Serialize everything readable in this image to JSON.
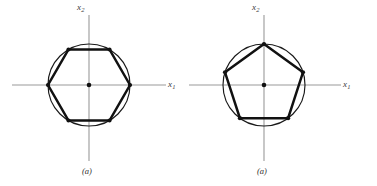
{
  "figure": {
    "background_color": "#ffffff",
    "ink_color": "#111111",
    "axis_color": "#9a9a9a",
    "panels": [
      {
        "id": "a-left",
        "caption": "(a)",
        "axis_x_label": "x",
        "axis_x_subscript": "1",
        "axis_y_label": "x",
        "axis_y_subscript": "2",
        "shape_name": "hexagon",
        "sides": 6,
        "center": {
          "x": 89,
          "y": 85
        },
        "circle_radius": 41,
        "polygon_radius": 41,
        "start_angle_deg": 0,
        "vertex_angles_deg": [
          0,
          60,
          120,
          180,
          240,
          300
        ],
        "origin_dot_radius": 2.3,
        "vertex_dot_radius": 2.1,
        "axis_x_start": {
          "x": 12,
          "y": 85
        },
        "axis_x_end": {
          "x": 166,
          "y": 85
        },
        "axis_y_start": {
          "x": 89,
          "y": 15
        },
        "axis_y_end": {
          "x": 89,
          "y": 161
        },
        "label_x_pos": {
          "x": 168,
          "y": 80
        },
        "label_y_pos": {
          "x": 77,
          "y": 3
        },
        "caption_pos": {
          "x": 82,
          "y": 167
        }
      },
      {
        "id": "a-right",
        "caption": "(a)",
        "axis_x_label": "x",
        "axis_x_subscript": "1",
        "axis_y_label": "x",
        "axis_y_subscript": "2",
        "shape_name": "pentagon",
        "sides": 5,
        "center": {
          "x": 75,
          "y": 85
        },
        "circle_radius": 41,
        "polygon_radius": 41,
        "start_angle_deg": 90,
        "vertex_angles_deg": [
          90,
          162,
          234,
          306,
          18
        ],
        "origin_dot_radius": 2.3,
        "vertex_dot_radius": 2.1,
        "axis_x_start": {
          "x": -1,
          "y": 85
        },
        "axis_x_end": {
          "x": 152,
          "y": 85
        },
        "axis_y_start": {
          "x": 75,
          "y": 15
        },
        "axis_y_end": {
          "x": 75,
          "y": 161
        },
        "label_x_pos": {
          "x": 154,
          "y": 80
        },
        "label_y_pos": {
          "x": 63,
          "y": 3
        },
        "caption_pos": {
          "x": 68,
          "y": 167
        }
      }
    ]
  }
}
